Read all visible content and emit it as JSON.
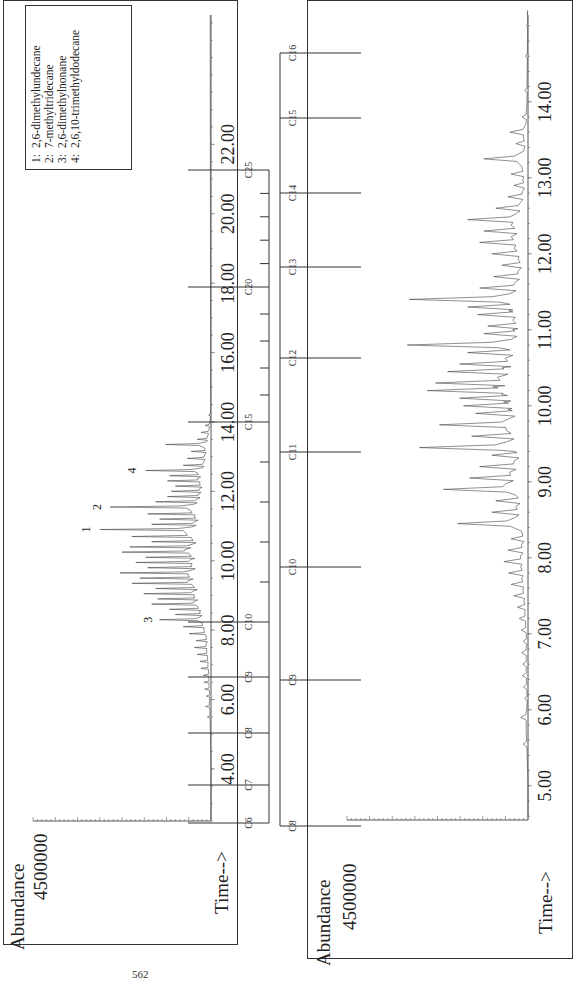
{
  "page_number": "562",
  "chart_data": [
    {
      "type": "line",
      "title": "",
      "orientation": "rotated-90-ccw",
      "xlabel": "Time-->",
      "ylabel": "Abundance",
      "y_tick_label": "4500000",
      "x_ticks": [
        "4.00",
        "6.00",
        "8.00",
        "10.00",
        "12.00",
        "14.00",
        "16.00",
        "18.00",
        "20.00",
        "22.00"
      ],
      "xlim": [
        2.5,
        25.5
      ],
      "ylim": [
        0,
        4500000
      ],
      "legend": {
        "placement": "top-right",
        "entries": [
          {
            "num": "1:",
            "name": "2,6-dimethylundecane"
          },
          {
            "num": "2:",
            "name": "7-methyltridecane"
          },
          {
            "num": "3:",
            "name": "2,6-dimethylnonane"
          },
          {
            "num": "4:",
            "name": "2,6,10-trimethyldodecane"
          }
        ]
      },
      "peak_labels": [
        {
          "label": "1",
          "time": 10.9,
          "abundance": 2850000
        },
        {
          "label": "2",
          "time": 11.55,
          "abundance": 2580000
        },
        {
          "label": "3",
          "time": 8.3,
          "abundance": 1300000
        },
        {
          "label": "4",
          "time": 12.6,
          "abundance": 1700000
        }
      ],
      "peaks": [
        [
          5.5,
          90000
        ],
        [
          5.8,
          140000
        ],
        [
          6.1,
          120000
        ],
        [
          6.3,
          160000
        ],
        [
          6.5,
          180000
        ],
        [
          6.7,
          200000
        ],
        [
          6.9,
          250000
        ],
        [
          7.1,
          280000
        ],
        [
          7.3,
          350000
        ],
        [
          7.5,
          420000
        ],
        [
          7.7,
          380000
        ],
        [
          7.9,
          550000
        ],
        [
          8.1,
          700000
        ],
        [
          8.3,
          1300000
        ],
        [
          8.45,
          900000
        ],
        [
          8.6,
          1050000
        ],
        [
          8.75,
          1500000
        ],
        [
          8.9,
          1350000
        ],
        [
          9.05,
          1700000
        ],
        [
          9.2,
          1400000
        ],
        [
          9.35,
          2000000
        ],
        [
          9.5,
          1800000
        ],
        [
          9.65,
          2300000
        ],
        [
          9.8,
          1600000
        ],
        [
          9.95,
          1900000
        ],
        [
          10.1,
          1650000
        ],
        [
          10.25,
          2250000
        ],
        [
          10.4,
          2050000
        ],
        [
          10.55,
          1500000
        ],
        [
          10.7,
          2000000
        ],
        [
          10.9,
          2800000
        ],
        [
          11.05,
          1500000
        ],
        [
          11.2,
          1300000
        ],
        [
          11.35,
          1600000
        ],
        [
          11.55,
          2550000
        ],
        [
          11.7,
          1400000
        ],
        [
          11.85,
          1100000
        ],
        [
          12.0,
          1000000
        ],
        [
          12.15,
          900000
        ],
        [
          12.3,
          1100000
        ],
        [
          12.45,
          1050000
        ],
        [
          12.6,
          1650000
        ],
        [
          12.75,
          700000
        ],
        [
          12.95,
          600000
        ],
        [
          13.15,
          500000
        ],
        [
          13.35,
          1150000
        ],
        [
          13.5,
          350000
        ],
        [
          13.7,
          250000
        ],
        [
          13.9,
          150000
        ],
        [
          14.2,
          60000
        ],
        [
          14.6,
          20000
        ]
      ]
    },
    {
      "type": "line",
      "title": "",
      "orientation": "rotated-90-ccw",
      "xlabel": "Time-->",
      "ylabel": "Abundance",
      "y_tick_label": "4500000",
      "x_ticks": [
        "5.00",
        "6.00",
        "7.00",
        "8.00",
        "9.00",
        "10.00",
        "11.00",
        "12.00",
        "13.00",
        "14.00"
      ],
      "xlim": [
        4.55,
        15.8
      ],
      "ylim": [
        0,
        4500000
      ],
      "peaks": [
        [
          5.55,
          120000
        ],
        [
          5.9,
          180000
        ],
        [
          6.15,
          80000
        ],
        [
          6.3,
          110000
        ],
        [
          6.45,
          140000
        ],
        [
          6.6,
          130000
        ],
        [
          6.75,
          160000
        ],
        [
          6.9,
          120000
        ],
        [
          7.05,
          170000
        ],
        [
          7.2,
          220000
        ],
        [
          7.35,
          260000
        ],
        [
          7.5,
          350000
        ],
        [
          7.65,
          420000
        ],
        [
          7.8,
          480000
        ],
        [
          7.95,
          600000
        ],
        [
          8.1,
          500000
        ],
        [
          8.25,
          420000
        ],
        [
          8.45,
          1750000
        ],
        [
          8.6,
          900000
        ],
        [
          8.75,
          800000
        ],
        [
          8.9,
          2100000
        ],
        [
          9.05,
          1450000
        ],
        [
          9.2,
          1200000
        ],
        [
          9.35,
          900000
        ],
        [
          9.45,
          2700000
        ],
        [
          9.6,
          1400000
        ],
        [
          9.75,
          2200000
        ],
        [
          9.9,
          1300000
        ],
        [
          10.0,
          1600000
        ],
        [
          10.1,
          1700000
        ],
        [
          10.2,
          2500000
        ],
        [
          10.3,
          2300000
        ],
        [
          10.45,
          2000000
        ],
        [
          10.55,
          1700000
        ],
        [
          10.7,
          1500000
        ],
        [
          10.8,
          3000000
        ],
        [
          10.95,
          1100000
        ],
        [
          11.05,
          1000000
        ],
        [
          11.2,
          1250000
        ],
        [
          11.3,
          1500000
        ],
        [
          11.4,
          2950000
        ],
        [
          11.55,
          1200000
        ],
        [
          11.7,
          850000
        ],
        [
          11.85,
          650000
        ],
        [
          12.0,
          900000
        ],
        [
          12.15,
          1200000
        ],
        [
          12.3,
          1100000
        ],
        [
          12.45,
          1500000
        ],
        [
          12.6,
          800000
        ],
        [
          12.75,
          500000
        ],
        [
          12.9,
          350000
        ],
        [
          13.05,
          420000
        ],
        [
          13.25,
          1100000
        ],
        [
          13.45,
          300000
        ],
        [
          13.6,
          450000
        ],
        [
          13.8,
          150000
        ],
        [
          14.15,
          80000
        ],
        [
          14.6,
          60000
        ],
        [
          15.0,
          30000
        ]
      ]
    }
  ],
  "alkane_scales": [
    {
      "name": "upper",
      "labels": [
        "C6",
        "C7",
        "C8",
        "C9",
        "C10",
        "C15",
        "C20",
        "C25"
      ]
    },
    {
      "name": "lower",
      "labels": [
        "C8",
        "C9",
        "C10",
        "C11",
        "C12",
        "C13",
        "C14",
        "C15",
        "C16"
      ]
    }
  ]
}
